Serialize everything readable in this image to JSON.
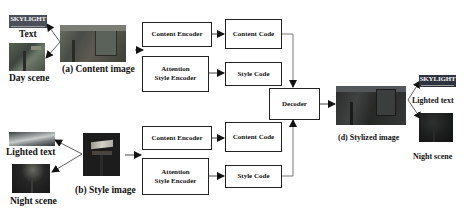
{
  "diagram": {
    "inputs": {
      "content_image_caption": "(a) Content image",
      "style_image_caption": "(b) Style image",
      "content_components": [
        {
          "label": "Text",
          "thumb_text": "SKYLIGHT"
        },
        {
          "label": "Day scene"
        }
      ],
      "style_components": [
        {
          "label": "Lighted text"
        },
        {
          "label": "Night scene"
        }
      ]
    },
    "top_branch": {
      "content_encoder": "Content Encoder",
      "content_code": "Content Code",
      "style_encoder_line1": "Attention",
      "style_encoder_line2": "Style Encoder",
      "style_code": "Style Code"
    },
    "bottom_branch": {
      "content_encoder": "Content Encoder",
      "content_code": "Content Code",
      "style_encoder_line1": "Attention",
      "style_encoder_line2": "Style Encoder",
      "style_code": "Style Code"
    },
    "decoder": "Decoder",
    "output": {
      "caption": "(d) Stylized image",
      "components": [
        {
          "label": "Lighted text",
          "thumb_text": "SKYLIGHT"
        },
        {
          "label": "Night scene"
        }
      ]
    }
  }
}
